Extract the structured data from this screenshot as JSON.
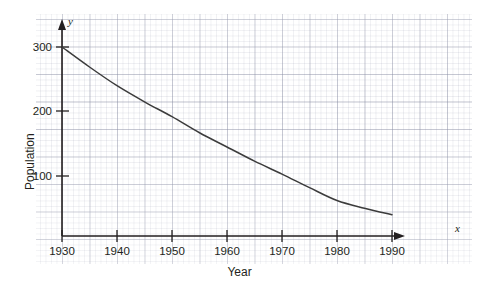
{
  "chart_data": {
    "type": "line",
    "title": "",
    "subtitle": "",
    "xlabel": "Year",
    "ylabel": "Population",
    "x_axis_variable": "x",
    "y_axis_variable": "y",
    "grid": true,
    "grid_style": "graph-paper",
    "legend": "none",
    "xlim": [
      1930,
      1990
    ],
    "ylim": [
      0,
      310
    ],
    "x_ticks": [
      1930,
      1940,
      1950,
      1960,
      1970,
      1980,
      1990
    ],
    "x_tick_labels": [
      "1930",
      "1940",
      "1950",
      "1960",
      "1970",
      "1980",
      "1990"
    ],
    "y_ticks": [
      100,
      200,
      300
    ],
    "y_tick_labels": [
      "100",
      "200",
      "300"
    ],
    "series": [
      {
        "name": "Population",
        "color": "#3b3b3b",
        "x": [
          1930,
          1935,
          1940,
          1945,
          1950,
          1955,
          1960,
          1965,
          1970,
          1975,
          1980,
          1985,
          1990
        ],
        "y": [
          300,
          269,
          240,
          215,
          192,
          167,
          145,
          123,
          103,
          82,
          62,
          50,
          40
        ]
      }
    ],
    "annotations": []
  },
  "axis_labels": {
    "x_variable": "x",
    "y_variable": "y",
    "x_title": "Year",
    "y_title": "Population"
  }
}
